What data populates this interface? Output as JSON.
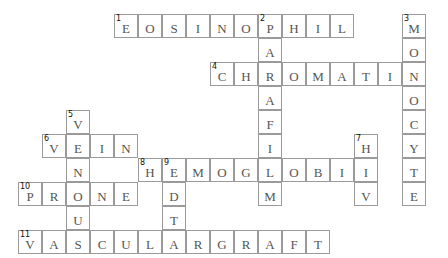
{
  "puzzle": {
    "cell_size": 24,
    "origin": {
      "x": 18,
      "y": 14
    },
    "words": [
      {
        "number": "1",
        "direction": "across",
        "row": 0,
        "col": 4,
        "answer": "EOSINOPHIL"
      },
      {
        "number": "2",
        "direction": "down",
        "row": 0,
        "col": 10,
        "answer": "PARAFILM"
      },
      {
        "number": "3",
        "direction": "down",
        "row": 0,
        "col": 16,
        "answer": "MONOCYTE"
      },
      {
        "number": "4",
        "direction": "across",
        "row": 2,
        "col": 8,
        "answer": "CHROMATIN"
      },
      {
        "number": "5",
        "direction": "down",
        "row": 4,
        "col": 2,
        "answer": "VENOUS"
      },
      {
        "number": "6",
        "direction": "across",
        "row": 5,
        "col": 1,
        "answer": "VEIN"
      },
      {
        "number": "7",
        "direction": "down",
        "row": 5,
        "col": 14,
        "answer": "HIV"
      },
      {
        "number": "8",
        "direction": "across",
        "row": 6,
        "col": 5,
        "answer": "HEMOGLOBIN"
      },
      {
        "number": "9",
        "direction": "down",
        "row": 6,
        "col": 6,
        "answer": "EDTA"
      },
      {
        "number": "10",
        "direction": "across",
        "row": 7,
        "col": 0,
        "answer": "PRONE"
      },
      {
        "number": "11",
        "direction": "across",
        "row": 9,
        "col": 0,
        "answer": "VASCULARGRAFT"
      }
    ]
  }
}
